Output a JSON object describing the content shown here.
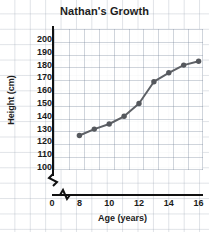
{
  "chart_data": {
    "type": "line",
    "title": "Nathan's Growth",
    "xlabel": "Age (years)",
    "ylabel": "Height (cm)",
    "x": [
      8,
      9,
      10,
      11,
      12,
      13,
      14,
      15,
      16
    ],
    "values": [
      125,
      130,
      134,
      140,
      150,
      167,
      174,
      180,
      183
    ],
    "series": [
      {
        "name": "Nathan's height",
        "x": [
          8,
          9,
          10,
          11,
          12,
          13,
          14,
          15,
          16
        ],
        "values": [
          125,
          130,
          134,
          140,
          150,
          167,
          174,
          180,
          183
        ]
      }
    ],
    "xlim": [
      7,
      17
    ],
    "ylim": [
      95,
      205
    ],
    "xticks": [
      0,
      8,
      10,
      12,
      14,
      16
    ],
    "xtick_labels": [
      "0",
      "8",
      "10",
      "12",
      "14",
      "16"
    ],
    "yticks": [
      100,
      110,
      120,
      130,
      140,
      150,
      160,
      170,
      180,
      190,
      200
    ],
    "ytick_labels": [
      "100",
      "110",
      "120",
      "130",
      "140",
      "150",
      "160",
      "170",
      "180",
      "190",
      "200"
    ],
    "grid": true,
    "legend": null,
    "axis_break_x": true,
    "axis_break_y": true,
    "marker": "circle",
    "line_color": "#5e6166",
    "marker_color": "#55585d",
    "grid_color": "#96a0af",
    "axis_color": "#111111",
    "background_color": "#ffffff"
  }
}
